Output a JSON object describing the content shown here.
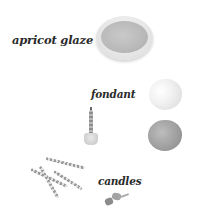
{
  "labels": {
    "glaze": "apricot glaze",
    "fondant": "fondant",
    "candles": "candles"
  },
  "items": [
    {
      "name": "bowl-of-apricot-glaze",
      "icon": "bowl-icon"
    },
    {
      "name": "white-fondant-ball",
      "icon": "ball-icon"
    },
    {
      "name": "grey-fondant-ball",
      "icon": "ball-icon"
    },
    {
      "name": "candle-in-holder",
      "icon": "candle-icon"
    },
    {
      "name": "striped-candles",
      "icon": "candles-icon"
    },
    {
      "name": "candle-holders",
      "icon": "holder-icon"
    }
  ],
  "colors": {
    "background": "#ffffff",
    "text": "#2a2a2a",
    "glaze": "#b9b9b9",
    "fondant_light": "#f0f0f0",
    "fondant_dark": "#9d9d9d"
  }
}
